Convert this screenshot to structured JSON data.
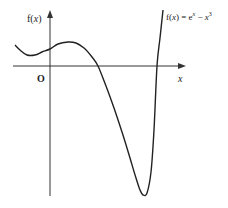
{
  "chart_data": {
    "type": "line",
    "title": "",
    "function_label": "f(x) = e^x − x^3",
    "function_label_parts": {
      "lhs": "f(",
      "var": "x",
      "mid": ") = e",
      "exp1": "x",
      "minus": " − ",
      "var2": "x",
      "exp2": "3"
    },
    "xlabel": "x",
    "ylabel": "f(x)",
    "ylabel_parts": {
      "f": "f(",
      "var": "x",
      "close": ")"
    },
    "origin_label": "O",
    "grid": false,
    "legend": "none",
    "series": [
      {
        "name": "f(x) = e^x - x^3",
        "points_px": [
          [
            15,
            45
          ],
          [
            20,
            50
          ],
          [
            27,
            55
          ],
          [
            35,
            55
          ],
          [
            42,
            52
          ],
          [
            50,
            49
          ],
          [
            58,
            44
          ],
          [
            68,
            42
          ],
          [
            76,
            43
          ],
          [
            84,
            48
          ],
          [
            92,
            57
          ],
          [
            98,
            66
          ],
          [
            106,
            86
          ],
          [
            114,
            108
          ],
          [
            122,
            132
          ],
          [
            130,
            158
          ],
          [
            136,
            178
          ],
          [
            140,
            190
          ],
          [
            143,
            195
          ],
          [
            147,
            193
          ],
          [
            151,
            172
          ],
          [
            154,
            130
          ],
          [
            157,
            66
          ],
          [
            160,
            38
          ],
          [
            163,
            10
          ]
        ]
      }
    ],
    "features": {
      "local_min_left_px": [
        27,
        55
      ],
      "local_max_px": [
        68,
        42
      ],
      "x_intercepts_px": [
        98,
        157
      ],
      "global_min_px": [
        143,
        195
      ]
    }
  },
  "colors": {
    "axis": "#333333",
    "curve": "#222222",
    "background": "#ffffff"
  }
}
